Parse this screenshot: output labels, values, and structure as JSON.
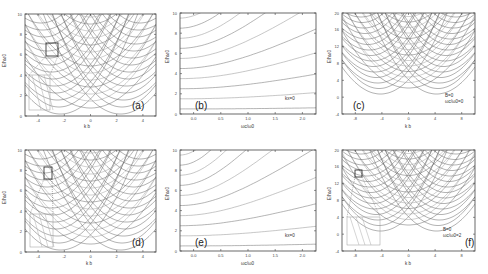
{
  "figure": {
    "panels": [
      {
        "id": "a",
        "tag": "(a)",
        "xlabel": "k b",
        "ylabel": "E/ħω0",
        "xticks": [
          "-4",
          "-2",
          "0",
          "2",
          "4"
        ],
        "yticks": [
          "10",
          "8",
          "6",
          "4",
          "2",
          "0"
        ],
        "annotation": []
      },
      {
        "id": "b",
        "tag": "(b)",
        "xlabel": "ωc/ω0",
        "ylabel": "E/ħω0",
        "xticks": [
          "0.0",
          "0.5",
          "1.0",
          "1.5",
          "2.0"
        ],
        "yticks": [
          "10",
          "8",
          "6",
          "4",
          "2",
          "0"
        ],
        "annotation": [
          "kx=0"
        ]
      },
      {
        "id": "c",
        "tag": "(c)",
        "xlabel": "k b",
        "ylabel": "E/ħω0",
        "xticks": [
          "-8",
          "-4",
          "0",
          "4",
          "8"
        ],
        "yticks": [
          "20",
          "16",
          "12",
          "8",
          "4",
          "0",
          "-4"
        ],
        "annotation": [
          "B=0",
          "ωc/ω0=0"
        ]
      },
      {
        "id": "d",
        "tag": "(d)",
        "xlabel": "k b",
        "ylabel": "E/ħω0",
        "xticks": [
          "-4",
          "-2",
          "0",
          "2",
          "4"
        ],
        "yticks": [
          "10",
          "8",
          "6",
          "4",
          "2",
          "0"
        ],
        "annotation": []
      },
      {
        "id": "e",
        "tag": "(e)",
        "xlabel": "ωc/ω0",
        "ylabel": "E/ħω0",
        "xticks": [
          "0.0",
          "0.5",
          "1.0",
          "1.5",
          "2.0"
        ],
        "yticks": [
          "10",
          "8",
          "6",
          "4",
          "2",
          "0"
        ],
        "annotation": [
          "kx=0"
        ]
      },
      {
        "id": "f",
        "tag": "(f)",
        "xlabel": "k b",
        "ylabel": "E/ħω0",
        "xticks": [
          "-8",
          "-4",
          "0",
          "4",
          "8"
        ],
        "yticks": [
          "20",
          "16",
          "12",
          "8",
          "4",
          "0",
          "-4"
        ],
        "annotation": [
          "B=0",
          "ωc/ω0=2"
        ]
      }
    ]
  },
  "chart_data": [
    {
      "type": "line",
      "title": "(a)",
      "xlabel": "k b",
      "ylabel": "E/ħω0",
      "xlim": [
        -5,
        5
      ],
      "ylim": [
        -0.5,
        10
      ],
      "description": "Family of parabolic energy bands E(k) vs k b, minima near 0.5,1.5,...; inset zoom box near k b≈-3, E≈6",
      "series_count": 20
    },
    {
      "type": "line",
      "title": "(b)",
      "xlabel": "ωc/ω0",
      "ylabel": "E/ħω0",
      "xlim": [
        0,
        2
      ],
      "ylim": [
        0,
        10
      ],
      "annotation": "kx=0",
      "description": "Energy levels vs ωc/ω0 rising with field; at ωc/ω0=0 levels at ~0.5,1.5,2.5,...9.5",
      "series_count": 10
    },
    {
      "type": "line",
      "title": "(c)",
      "xlabel": "k b",
      "ylabel": "E/ħω0",
      "xlim": [
        -9,
        9
      ],
      "ylim": [
        -5,
        20
      ],
      "annotation": "B=0, ωc/ω0=0",
      "description": "Parabolic bands with minimum near E≈1",
      "series_count": 20
    },
    {
      "type": "line",
      "title": "(d)",
      "xlabel": "k b",
      "ylabel": "E/ħω0",
      "xlim": [
        -5,
        5
      ],
      "ylim": [
        -0.5,
        10
      ],
      "description": "Parabolic bands with inset zoom box near k b≈-3, E≈8",
      "series_count": 20
    },
    {
      "type": "line",
      "title": "(e)",
      "xlabel": "ωc/ω0",
      "ylabel": "E/ħω0",
      "xlim": [
        0,
        2
      ],
      "ylim": [
        0,
        10
      ],
      "annotation": "kx=0",
      "description": "Energy levels vs ωc/ω0",
      "series_count": 10
    },
    {
      "type": "line",
      "title": "(f)",
      "xlabel": "k b",
      "ylabel": "E/ħω0",
      "xlim": [
        -9,
        9
      ],
      "ylim": [
        -5,
        20
      ],
      "annotation": "B=0, ωc/ω0=2",
      "description": "Parabolic bands with minimum near E≈1, inset zoom box near k b≈-7",
      "series_count": 20
    }
  ]
}
